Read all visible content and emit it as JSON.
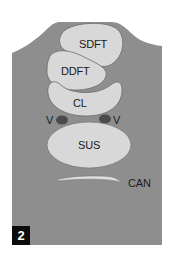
{
  "figure": {
    "panel_number": "2",
    "colors": {
      "background": "#ffffff",
      "body": "#8e8e8e",
      "structure_fill": "#d8d8d8",
      "structure_outline": "#6a6a6a",
      "vessel": "#4a4a4a",
      "label": "#1a1a1a",
      "panel_box": "#0c0c0c"
    },
    "labels": {
      "sdft": "SDFT",
      "ddft": "DDFT",
      "cl": "CL",
      "vessel_left": "V",
      "vessel_right": "V",
      "sus": "SUS",
      "can": "CAN"
    }
  }
}
